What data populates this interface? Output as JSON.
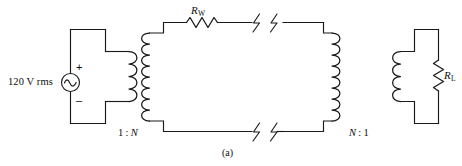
{
  "figure": {
    "caption": "(a)",
    "type": "circuit-diagram"
  },
  "source": {
    "label": "120 V rms",
    "plus_sign": "+",
    "minus_sign": "–",
    "symbol": "ac-source-sine"
  },
  "transformers": {
    "left": {
      "ratio_label": "1 : N",
      "ratio_primary": "1",
      "ratio_separator": ":",
      "ratio_secondary": "N",
      "primary_turns": 4,
      "secondary_turns": 8
    },
    "right": {
      "ratio_label": "N : 1",
      "ratio_primary": "N",
      "ratio_separator": ":",
      "ratio_secondary": "1",
      "primary_turns": 8,
      "secondary_turns": 4
    }
  },
  "resistors": {
    "line": {
      "label": "R",
      "subscript": "W",
      "orientation": "horizontal"
    },
    "load": {
      "label": "R",
      "subscript": "L",
      "orientation": "vertical"
    }
  },
  "break_marks": {
    "count": 2,
    "locations": [
      "top-line",
      "bottom-line"
    ],
    "symbol": "line-break-slash"
  },
  "colors": {
    "background": "#ffffff",
    "wire": "#1a1a1a",
    "text": "#0d0d0d"
  }
}
